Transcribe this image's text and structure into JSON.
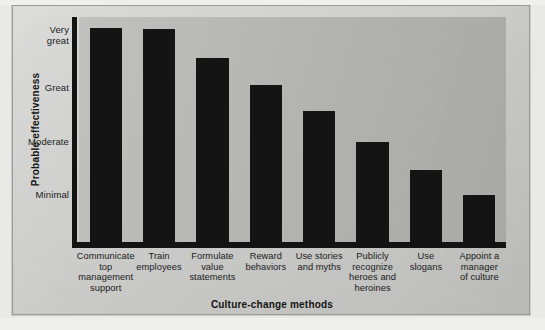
{
  "figure": {
    "background_color": "#d3d3d1",
    "plot_background_color": "#b9b9b7",
    "bar_color": "#141414",
    "axis_color": "#131313"
  },
  "chart_data": {
    "type": "bar",
    "title": "",
    "xlabel": "Culture-change methods",
    "ylabel": "Probable effectiveness",
    "grid": false,
    "legend": "none",
    "ytick_labels": [
      "Very great",
      "Great",
      "Moderate",
      "Minimal"
    ],
    "ytick_values": [
      4,
      3,
      2,
      1
    ],
    "ylim": [
      0,
      4.35
    ],
    "categories": [
      "Communicate top management support",
      "Train employees",
      "Formulate value statements",
      "Reward behaviors",
      "Use stories and myths",
      "Publicly recognize heroes and heroines",
      "Use slogans",
      "Appoint a manager of culture"
    ],
    "values": [
      4.15,
      4.13,
      3.58,
      3.07,
      2.58,
      2.0,
      1.47,
      1.0
    ],
    "value_labels": [
      "Very great",
      "Very great",
      "Between great and very great",
      "Great",
      "Between moderate and great",
      "Moderate",
      "Between minimal and moderate",
      "Minimal"
    ]
  },
  "y_axis": {
    "title": "Probable effectiveness",
    "ticks": [
      {
        "label_line1": "Very",
        "label_line2": "great"
      },
      {
        "label_line1": "Great",
        "label_line2": ""
      },
      {
        "label_line1": "Moderate",
        "label_line2": ""
      },
      {
        "label_line1": "Minimal",
        "label_line2": ""
      }
    ]
  },
  "x_axis": {
    "title": "Culture-change methods",
    "ticks": [
      {
        "lines": [
          "Communicate",
          "top",
          "management",
          "support"
        ]
      },
      {
        "lines": [
          "Train",
          "employees"
        ]
      },
      {
        "lines": [
          "Formulate",
          "value",
          "statements"
        ]
      },
      {
        "lines": [
          "Reward",
          "behaviors"
        ]
      },
      {
        "lines": [
          "Use stories",
          "and myths"
        ]
      },
      {
        "lines": [
          "Publicly",
          "recognize",
          "heroes and",
          "heroines"
        ]
      },
      {
        "lines": [
          "Use",
          "slogans"
        ]
      },
      {
        "lines": [
          "Appoint a",
          "manager",
          "of culture"
        ]
      }
    ]
  },
  "cropped_header_text": ""
}
